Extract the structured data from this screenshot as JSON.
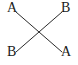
{
  "canvas": {
    "width": 78,
    "height": 65,
    "background_color": "#ffffff"
  },
  "diagram": {
    "type": "crossing-lines",
    "stroke_color": "#2b2b2b",
    "stroke_width": 1,
    "intersection": {
      "x": 39,
      "y": 33
    },
    "segments": [
      {
        "name": "segment-top-left-to-bottom-right",
        "x1": 16,
        "y1": 12,
        "x2": 62,
        "y2": 52
      },
      {
        "name": "segment-bottom-left-to-top-right",
        "x1": 16,
        "y1": 52,
        "x2": 62,
        "y2": 12
      }
    ],
    "labels": {
      "top_left": "A",
      "top_right": "B",
      "bottom_left": "B",
      "bottom_right": "A"
    },
    "label_color": "#1a1a1a"
  }
}
